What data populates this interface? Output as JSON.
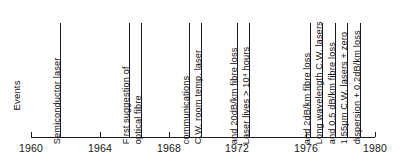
{
  "chart_data": {
    "type": "timeline",
    "title": "",
    "ylabel": "Events",
    "xlabel": "",
    "xlim": [
      1960,
      1980
    ],
    "grid": false,
    "legend": null,
    "axis_ticks": [
      {
        "year": 1960,
        "label": "1960"
      },
      {
        "year": 1964,
        "label": "1964"
      },
      {
        "year": 1968,
        "label": "1968"
      },
      {
        "year": 1972,
        "label": "1972"
      },
      {
        "year": 1976,
        "label": "1976"
      },
      {
        "year": 1980,
        "label": "1980"
      }
    ],
    "events": [
      {
        "year": 1961.7,
        "label": "Semiconductor laser"
      },
      {
        "year": 1965.7,
        "label": "First suggestion of"
      },
      {
        "year": 1966.4,
        "label": "optical fibre"
      },
      {
        "year": 1969.2,
        "label": "communications"
      },
      {
        "year": 1969.9,
        "label": "C.W. room temp. laser"
      },
      {
        "year": 1972.0,
        "label": "and 20dB/km fibre loss"
      },
      {
        "year": 1972.7,
        "label": "Laser lives > 10⁴ hours"
      },
      {
        "year": 1976.2,
        "label": "and 2dB/km fibre loss"
      },
      {
        "year": 1976.9,
        "label": "Long wavelength C.W. lasers"
      },
      {
        "year": 1977.7,
        "label": "and 0.5 dB/km fibre loss"
      },
      {
        "year": 1978.4,
        "label": "1.55μm C.W. lasers + zero"
      },
      {
        "year": 1979.1,
        "label": "dispersion + 0.2dB/km loss"
      }
    ]
  },
  "colors": {
    "ink": "#1a1a1a",
    "background": "#ffffff"
  }
}
